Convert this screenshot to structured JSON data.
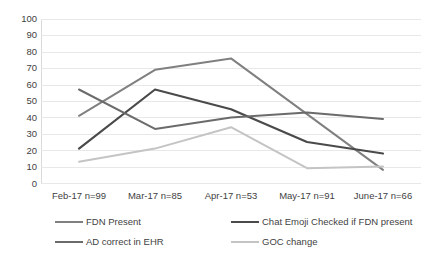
{
  "chart_data": {
    "type": "line",
    "title": "",
    "xlabel": "",
    "ylabel": "",
    "ylim": [
      0,
      100
    ],
    "ytick_step": 10,
    "grid": true,
    "legend_position": "bottom",
    "categories": [
      "Feb-17  n=99",
      "Mar-17 n=85",
      "Apr-17  n=53",
      "May-17 n=91",
      "June-17 n=66"
    ],
    "yticks": [
      "100",
      "90",
      "80",
      "70",
      "60",
      "50",
      "40",
      "30",
      "20",
      "10",
      "0"
    ],
    "series": [
      {
        "name": "FDN Present",
        "color": "#808080",
        "width": 2,
        "values": [
          41,
          69,
          76,
          42,
          8
        ]
      },
      {
        "name": "Chat Emoji Checked if FDN  present",
        "color": "#4a4a4a",
        "width": 2.2,
        "values": [
          21,
          57,
          45,
          25,
          18
        ]
      },
      {
        "name": "AD correct in EHR",
        "color": "#6b6b6b",
        "width": 2,
        "values": [
          57,
          33,
          40,
          43,
          39
        ]
      },
      {
        "name": "GOC change",
        "color": "#c4c4c4",
        "width": 2,
        "values": [
          13,
          21,
          34,
          9,
          10
        ]
      }
    ]
  }
}
